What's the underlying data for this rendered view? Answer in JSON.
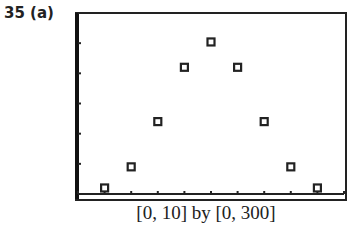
{
  "problem_label": "35 (a)",
  "caption": "[0, 10] by [0, 300]",
  "chart_data": {
    "type": "scatter",
    "title": "",
    "xlabel": "",
    "ylabel": "",
    "xlim": [
      0,
      10
    ],
    "ylim": [
      0,
      300
    ],
    "xticks": [
      0,
      1,
      2,
      3,
      4,
      5,
      6,
      7,
      8,
      9,
      10
    ],
    "yticks": [
      0,
      50,
      100,
      150,
      200,
      250,
      300
    ],
    "grid": false,
    "series": [
      {
        "name": "points",
        "marker": "square",
        "x": [
          1,
          2,
          3,
          4,
          5,
          6,
          7,
          8,
          9
        ],
        "y": [
          10,
          45,
          120,
          210,
          252,
          210,
          120,
          45,
          10
        ]
      }
    ]
  }
}
